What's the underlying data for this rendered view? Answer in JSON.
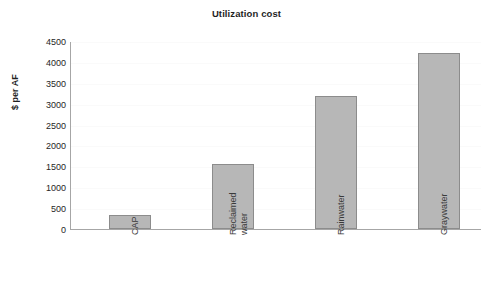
{
  "chart_data": {
    "type": "bar",
    "title": "Utilization cost",
    "xlabel": "",
    "ylabel": "$ per AF",
    "categories": [
      "CAP",
      "Reclaimed water",
      "Rainwater",
      "Graywater"
    ],
    "values": [
      340,
      1550,
      3190,
      4220
    ],
    "ylim": [
      0,
      4500
    ],
    "yticks": [
      0,
      500,
      1000,
      1500,
      2000,
      2500,
      3000,
      3500,
      4000,
      4500
    ],
    "ytick_labels": [
      "0",
      "500",
      "1000",
      "1500",
      "2000",
      "2500",
      "3000",
      "3500",
      "4000",
      "4500"
    ],
    "grid": true,
    "legend": null,
    "bar_color": "#b7b7b7",
    "bar_edge_color": "#8c8c8c",
    "axis_color": "#a6a6a6",
    "gridline_color": "#fafafa",
    "text_color": "#1f1f1f",
    "background": "#ffffff",
    "category_label_rotation": -90
  },
  "chart": {
    "title": "Utilization cost",
    "y_axis_title": "$ per AF",
    "category_labels": [
      {
        "lines": [
          "CAP"
        ]
      },
      {
        "lines": [
          "Reclaimed",
          "water"
        ]
      },
      {
        "lines": [
          "Rainwater"
        ]
      },
      {
        "lines": [
          "Graywater"
        ]
      }
    ]
  }
}
